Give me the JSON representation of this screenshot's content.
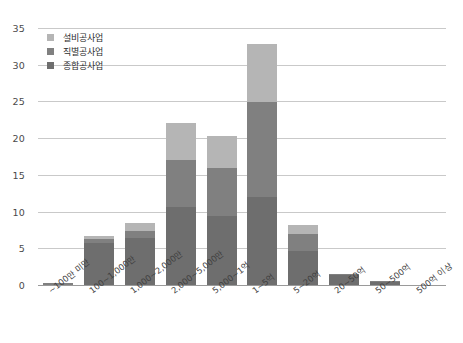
{
  "chart_data": {
    "type": "bar",
    "title": "",
    "subtitle": "",
    "xlabel": "",
    "ylabel": "",
    "stacked": true,
    "grid": true,
    "legend_position": "top-left",
    "ylim": [
      0,
      35
    ],
    "yticks": [
      0,
      5,
      10,
      15,
      20,
      25,
      30,
      35
    ],
    "ytick_labels": [
      "0",
      "5",
      "10",
      "15",
      "20",
      "25",
      "30",
      "35"
    ],
    "categories": [
      "~100만 미만",
      "100~1,000만",
      "1,000~2,000만",
      "2,000~5,000만",
      "5,000~1억",
      "1~5억",
      "5~20억",
      "20~50억",
      "50~500억",
      "500억 이상"
    ],
    "series": [
      {
        "name": "종합공사업",
        "color": "#6e6e6e",
        "values": [
          0.0,
          5.7,
          6.4,
          10.6,
          9.4,
          12.0,
          4.6,
          1.4,
          0.55,
          0.0
        ]
      },
      {
        "name": "직별공사업",
        "color": "#808080",
        "values": [
          0.3,
          0.6,
          1.0,
          6.4,
          6.6,
          12.9,
          2.3,
          0.15,
          0.05,
          0.0
        ]
      },
      {
        "name": "설비공사업",
        "color": "#b5b5b5",
        "values": [
          0.0,
          0.4,
          1.1,
          5.0,
          4.3,
          7.9,
          1.3,
          0.0,
          0.0,
          0.0
        ]
      }
    ],
    "totals": [
      0.3,
      6.7,
      8.5,
      22.0,
      20.3,
      32.8,
      8.2,
      1.55,
      0.6,
      0.0
    ]
  },
  "legend": {
    "items": [
      {
        "label": "설비공사업",
        "color": "#b5b5b5"
      },
      {
        "label": "직별공사업",
        "color": "#808080"
      },
      {
        "label": "종합공사업",
        "color": "#6e6e6e"
      }
    ]
  },
  "axis_colors": {
    "gridline": "#c9c9c9",
    "baseline": "#9a9a9a",
    "tick_text": "#4a4a4a"
  }
}
